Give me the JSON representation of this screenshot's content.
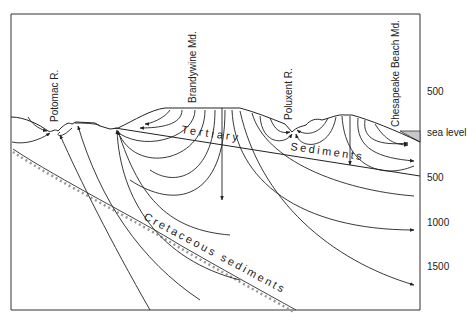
{
  "diagram": {
    "type": "hydrogeologic cross-section",
    "place_labels": [
      {
        "id": "potomac",
        "text": "Potomac R."
      },
      {
        "id": "brandywine",
        "text": "Brandywine Md."
      },
      {
        "id": "poluxent",
        "text": "Poluxent R."
      },
      {
        "id": "chesapeake",
        "text": "Chesapeake Beach Md."
      }
    ],
    "layer_labels": {
      "tertiary": "Tertiary",
      "tertiary_sediments": "Sediments",
      "cretaceous": "Cretaceous sediments"
    },
    "depth_axis": {
      "ticks": [
        "500",
        "sea level",
        "500",
        "1000",
        "1500"
      ]
    },
    "colors": {
      "line": "#222222",
      "frame": "#333333",
      "sea": "#c8c8c8",
      "cretaceous_hatch": "#999999"
    }
  }
}
